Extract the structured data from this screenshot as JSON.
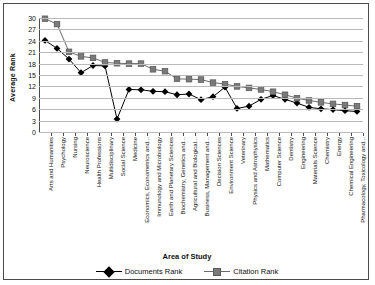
{
  "chart_data": {
    "type": "line",
    "title": "",
    "xlabel": "Area of Study",
    "ylabel": "Average Rank",
    "ylim": [
      0,
      30
    ],
    "yticks": [
      0,
      3,
      6,
      9,
      12,
      15,
      18,
      21,
      24,
      27,
      30
    ],
    "grid": true,
    "legend_position": "bottom",
    "categories": [
      "Arts and Humanities",
      "Psychology",
      "Nursing",
      "Neuroscience",
      "Health Professions",
      "Multidisciplinary",
      "Social Science",
      "Medicine",
      "Economics, Econometrics and...",
      "Immunology and Microbiology",
      "Earth and Planetary Sciences",
      "Biochemistry, Genetics and...",
      "Agricultural and Biological...",
      "Business, Management and...",
      "Decision Sciences",
      "Environment Science",
      "Veterinary",
      "Physics and Astrophysics",
      "Mathematics",
      "Computer Science",
      "Dentistry",
      "Engineering",
      "Materials Science",
      "Chemistry",
      "Energy",
      "Chemical Engineering",
      "Pharmacology, Toxicology and..."
    ],
    "series": [
      {
        "name": "Documents Rank",
        "marker": "diamond",
        "color": "#000000",
        "values": [
          24.1,
          22.0,
          19.2,
          15.6,
          17.5,
          17.4,
          3.4,
          11.2,
          11.1,
          10.7,
          10.6,
          9.8,
          10.0,
          8.5,
          9.3,
          11.8,
          6.2,
          6.8,
          8.6,
          9.6,
          8.6,
          7.6,
          6.5,
          6.1,
          5.9,
          5.6,
          5.4
        ]
      },
      {
        "name": "Citation Rank",
        "marker": "square",
        "color": "#7a7a7a",
        "values": [
          29.8,
          28.4,
          21.1,
          19.9,
          19.5,
          18.3,
          18.1,
          18.0,
          18.0,
          16.5,
          16.0,
          14.0,
          13.9,
          13.8,
          13.0,
          12.6,
          12.0,
          11.6,
          11.2,
          10.6,
          9.8,
          8.9,
          8.3,
          7.8,
          7.4,
          7.1,
          6.8
        ]
      }
    ]
  },
  "legend": {
    "documents_label": "Documents Rank",
    "citation_label": "Citation Rank"
  },
  "axis": {
    "y_title": "Average Rank",
    "x_title": "Area of Study"
  }
}
